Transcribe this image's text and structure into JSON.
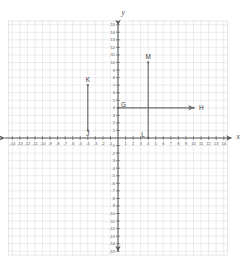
{
  "figure": {
    "kind": "coordinate-plane",
    "axis_labels": {
      "x": "x",
      "y": "y"
    },
    "background": "#ffffff",
    "grid_color": "#d8d8dc",
    "axis_color": "#595959",
    "segment_color": "#6b6b6b",
    "label_color": "#3c3c3c",
    "tick_label_color": "#5a5a5a"
  },
  "chart_data": {
    "type": "scatter",
    "title": "",
    "xlabel": "x",
    "ylabel": "y",
    "xlim": [
      -14,
      14
    ],
    "ylim": [
      -15,
      15
    ],
    "grid": true,
    "legend": "none",
    "x_ticks": [
      -14,
      -13,
      -12,
      -11,
      -10,
      -9,
      -8,
      -7,
      -6,
      -5,
      -4,
      -3,
      -2,
      -1,
      1,
      2,
      3,
      4,
      5,
      6,
      7,
      8,
      9,
      10,
      11,
      12,
      13,
      14
    ],
    "y_ticks": [
      -15,
      -14,
      -13,
      -12,
      -11,
      -10,
      -9,
      -8,
      -7,
      -6,
      -5,
      -4,
      -3,
      -2,
      -1,
      1,
      2,
      3,
      4,
      5,
      6,
      7,
      8,
      9,
      10,
      11,
      12,
      13,
      14,
      15
    ],
    "x_tick_labels": [
      "-14",
      "-13",
      "-12",
      "-11",
      "-10",
      "-9",
      "-8",
      "-7",
      "-6",
      "-5",
      "-4",
      "-3",
      "-2",
      "-1",
      "1",
      "2",
      "3",
      "4",
      "5",
      "6",
      "7",
      "8",
      "9",
      "10",
      "11",
      "12",
      "13",
      "14"
    ],
    "y_tick_labels": [
      "-15",
      "-14",
      "-13",
      "-12",
      "-11",
      "-10",
      "-9",
      "-8",
      "-7",
      "-6",
      "-5",
      "-4",
      "-3",
      "-2",
      "-1",
      "1",
      "2",
      "3",
      "4",
      "5",
      "6",
      "7",
      "8",
      "9",
      "10",
      "11",
      "12",
      "13",
      "14",
      "15"
    ],
    "annotations": [
      {
        "name": "K",
        "label": "K",
        "x": -4,
        "y": 7
      },
      {
        "name": "J",
        "label": "J",
        "x": -4,
        "y": 1
      },
      {
        "name": "G",
        "label": "G",
        "x": 0,
        "y": 4
      },
      {
        "name": "H",
        "label": "H",
        "x": 10,
        "y": 4
      },
      {
        "name": "M",
        "label": "M",
        "x": 4,
        "y": 10
      },
      {
        "name": "L",
        "label": "L",
        "x": 4,
        "y": 0
      }
    ],
    "shapes": [
      {
        "name": "segment-KJ",
        "kind": "segment",
        "from": [
          -4,
          7
        ],
        "to": [
          -4,
          1
        ],
        "arrow_start": false,
        "arrow_end": false
      },
      {
        "name": "ray-GH",
        "kind": "ray",
        "from": [
          0,
          4
        ],
        "to": [
          10,
          4
        ],
        "arrow_start": false,
        "arrow_end": true
      },
      {
        "name": "segment-ML",
        "kind": "segment",
        "from": [
          4,
          10
        ],
        "to": [
          4,
          0
        ],
        "arrow_start": false,
        "arrow_end": false
      }
    ]
  },
  "geometry": {
    "origin_px": [
      118,
      138
    ],
    "unit_px": 7.55,
    "grid_left": -14.5,
    "grid_right": 14.5,
    "grid_top": 15.5,
    "grid_bottom": -15.5
  }
}
